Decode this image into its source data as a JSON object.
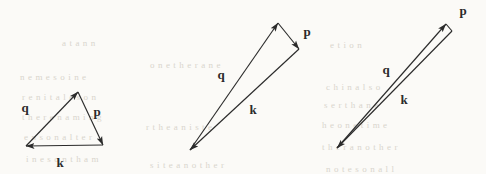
{
  "figure": {
    "name": "vector-triangle-sequence",
    "background_color": "#fbfaf7",
    "ink_color": "#2b2b2b",
    "width": 486,
    "height": 174
  },
  "diagram_data": {
    "type": "vector-diagram",
    "description": "Three momentum-conservation vector triangles k = p + q shown at decreasing opening angle, from a broad triangle to a nearly collinear sliver.",
    "vector_labels": [
      "q",
      "p",
      "k"
    ],
    "panels": [
      {
        "id": "panel-1",
        "label": "wide-triangle",
        "vertices": {
          "origin": [
            26,
            146
          ],
          "apex": [
            78,
            92
          ],
          "head": [
            103,
            145
          ]
        },
        "edges": [
          {
            "label": "q",
            "from": "origin",
            "to": "apex",
            "label_pos": [
              25,
              112
            ]
          },
          {
            "label": "p",
            "from": "apex",
            "to": "head",
            "label_pos": [
              97,
              116
            ]
          },
          {
            "label": "k",
            "from": "origin",
            "to": "head",
            "label_pos": [
              60,
              167
            ]
          }
        ],
        "arrowheads": [
          "origin",
          "apex",
          "head"
        ]
      },
      {
        "id": "panel-2",
        "label": "narrow-triangle",
        "vertices": {
          "origin": [
            190,
            150
          ],
          "apex": [
            278,
            23
          ],
          "head": [
            299,
            49
          ]
        },
        "edges": [
          {
            "label": "q",
            "from": "origin",
            "to": "apex",
            "label_pos": [
              221,
              79
            ]
          },
          {
            "label": "p",
            "from": "apex",
            "to": "head",
            "label_pos": [
              307,
              36
            ]
          },
          {
            "label": "k",
            "from": "origin",
            "to": "head",
            "label_pos": [
              253,
              114
            ]
          }
        ],
        "arrowheads": [
          "origin",
          "apex",
          "head"
        ]
      },
      {
        "id": "panel-3",
        "label": "collinear-sliver",
        "vertices": {
          "origin": [
            337,
            148
          ],
          "apex": [
            446,
            24
          ],
          "head": [
            452,
            31
          ]
        },
        "edges": [
          {
            "label": "q",
            "from": "origin",
            "to": "apex",
            "label_pos": [
              386,
              74
            ]
          },
          {
            "label": "p",
            "from": "apex",
            "to": "head",
            "label_pos": [
              463,
              15
            ]
          },
          {
            "label": "k",
            "from": "origin",
            "to": "head",
            "label_pos": [
              404,
              104
            ]
          }
        ],
        "arrowheads": [
          "origin",
          "apex",
          "head"
        ]
      }
    ]
  },
  "bleedthrough": {
    "note": "faint reverse-side text visible through the scanned page",
    "lines": [
      {
        "text": "a   t   a   n   n",
        "x": 62,
        "y": 38
      },
      {
        "text": "n   e   m   e   s   o   i   n   e",
        "x": 20,
        "y": 72
      },
      {
        "text": "r   e   n   i   t   a   l   e   s   o   n",
        "x": 22,
        "y": 92
      },
      {
        "text": "t   h   e   r   e   n   a   m   i   n   g",
        "x": 22,
        "y": 112
      },
      {
        "text": "e   n   s   o   n   a   l   t   e   r",
        "x": 24,
        "y": 132
      },
      {
        "text": "i   n   e   s   o   n   t   h   a   m",
        "x": 26,
        "y": 154
      },
      {
        "text": "o   n   e   t   h   e   r   a   n   e",
        "x": 150,
        "y": 60
      },
      {
        "text": "r   t   h   e   a   n   i   s   t   e",
        "x": 146,
        "y": 122
      },
      {
        "text": "s   i   t   e   a   n   o   t   h   e   r",
        "x": 150,
        "y": 160
      },
      {
        "text": "e   t   i   o   n",
        "x": 330,
        "y": 40
      },
      {
        "text": "c   h   i   n   a   l   s   o",
        "x": 326,
        "y": 82
      },
      {
        "text": "s   e   r   t   h   a   n   e",
        "x": 324,
        "y": 100
      },
      {
        "text": "h   e   o   n   e   t   i   m   e",
        "x": 322,
        "y": 120
      },
      {
        "text": "t   h   e   r   a   n   o   t   h   e   r",
        "x": 322,
        "y": 142
      },
      {
        "text": "n   o   t   e   s   o   n   a   l   l",
        "x": 326,
        "y": 164
      }
    ]
  }
}
